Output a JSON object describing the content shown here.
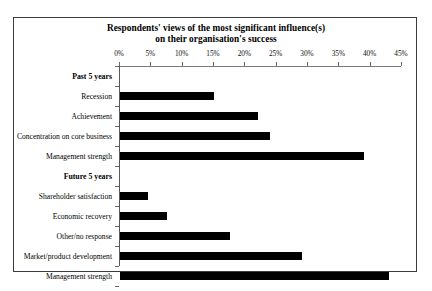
{
  "chart_data": {
    "type": "bar",
    "orientation": "horizontal",
    "title": "Respondents' views of the most significant influence(s)",
    "title_line2": "on their organisation's success",
    "xlabel": "",
    "ylabel": "",
    "xlim": [
      0,
      45
    ],
    "xtick_labels": [
      "0%",
      "5%",
      "10%",
      "15%",
      "20%",
      "25%",
      "30%",
      "35%",
      "40%",
      "45%"
    ],
    "xtick_values": [
      0,
      5,
      10,
      15,
      20,
      25,
      30,
      35,
      40,
      45
    ],
    "grid": false,
    "legend": "none",
    "bar_color": "#000000",
    "groups": [
      {
        "name": "Past 5 years",
        "categories": [
          "Recession",
          "Achievement",
          "Concentration on core business",
          "Management strength"
        ],
        "values": [
          15,
          22,
          24,
          39
        ]
      },
      {
        "name": "Future 5 years",
        "categories": [
          "Shareholder satisfaction",
          "Economic recovery",
          "Other/no response",
          "Market/product development",
          "Management strength"
        ],
        "values": [
          4.5,
          7.5,
          17.5,
          29,
          43
        ]
      }
    ],
    "rows": [
      {
        "label": "Past 5 years",
        "is_group": true,
        "value": null
      },
      {
        "label": "Recession",
        "is_group": false,
        "value": 15
      },
      {
        "label": "Achievement",
        "is_group": false,
        "value": 22
      },
      {
        "label": "Concentration on core business",
        "is_group": false,
        "value": 24
      },
      {
        "label": "Management strength",
        "is_group": false,
        "value": 39
      },
      {
        "label": "Future 5 years",
        "is_group": true,
        "value": null
      },
      {
        "label": "Shareholder satisfaction",
        "is_group": false,
        "value": 4.5
      },
      {
        "label": "Economic recovery",
        "is_group": false,
        "value": 7.5
      },
      {
        "label": "Other/no response",
        "is_group": false,
        "value": 17.5
      },
      {
        "label": "Market/product development",
        "is_group": false,
        "value": 29
      },
      {
        "label": "Management strength",
        "is_group": false,
        "value": 43
      }
    ]
  }
}
